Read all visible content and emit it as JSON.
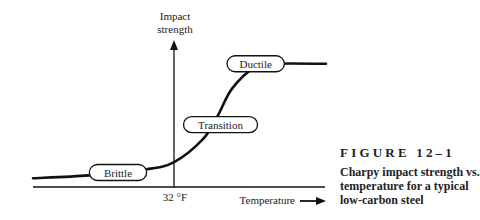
{
  "chart_data": {
    "type": "line",
    "title": "Charpy impact strength vs. temperature for a typical low-carbon steel",
    "xlabel": "Temperature",
    "ylabel": "Impact strength",
    "x_ticks": [
      {
        "value": 0.48,
        "label": "32 °F"
      }
    ],
    "xlim": [
      0,
      1
    ],
    "ylim": [
      0,
      1
    ],
    "grid": false,
    "legend": "none",
    "series": [
      {
        "name": "Impact strength",
        "x": [
          0.0,
          0.19,
          0.38,
          0.48,
          0.58,
          0.63,
          0.68,
          0.76,
          0.82,
          1.0
        ],
        "y": [
          0.06,
          0.08,
          0.12,
          0.17,
          0.33,
          0.49,
          0.68,
          0.83,
          0.85,
          0.85
        ]
      }
    ],
    "annotations": [
      {
        "label": "Brittle",
        "x": 0.29,
        "y": 0.1
      },
      {
        "label": "Transition",
        "x": 0.64,
        "y": 0.43
      },
      {
        "label": "Ductile",
        "x": 0.76,
        "y": 0.85
      }
    ]
  },
  "axes": {
    "y_label_line1": "Impact",
    "y_label_line2": "strength",
    "x_label": "Temperature",
    "x_tick": "32 °F"
  },
  "caption": {
    "figure_number": "FIGURE 12–1",
    "text": "Charpy impact strength vs. temperature for a typical low-carbon steel"
  }
}
